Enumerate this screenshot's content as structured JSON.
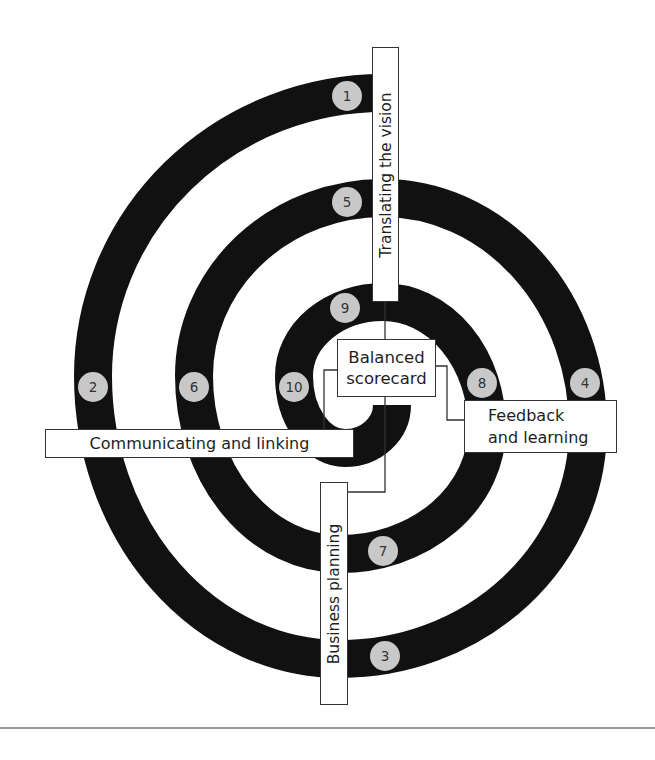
{
  "diagram": {
    "center": {
      "line1": "Balanced",
      "line2": "scorecard"
    },
    "processes": {
      "translating": "Translating the vision",
      "communicating": "Communicating and linking",
      "business_planning": "Business planning",
      "feedback": {
        "line1": "Feedback",
        "line2": "and learning"
      }
    },
    "steps": [
      "1",
      "2",
      "3",
      "4",
      "5",
      "6",
      "7",
      "8",
      "9",
      "10"
    ]
  },
  "colors": {
    "spiral": "#111111",
    "step_fill": "#c8c8c8",
    "connector": "#333333",
    "rule": "#7a7a7a"
  }
}
